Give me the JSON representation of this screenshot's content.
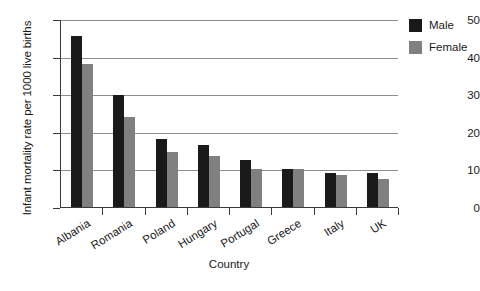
{
  "chart_data": {
    "type": "bar",
    "title": "",
    "xlabel": "Country",
    "ylabel": "Infant mortality rate per 1000 live births",
    "categories": [
      "Albania",
      "Romania",
      "Poland",
      "Hungary",
      "Portugal",
      "Greece",
      "Italy",
      "UK"
    ],
    "series": [
      {
        "name": "Male",
        "color": "#1a1a1a",
        "values": [
          45.5,
          29.8,
          18.0,
          16.5,
          12.5,
          10.2,
          9.0,
          9.0
        ]
      },
      {
        "name": "Female",
        "color": "#808080",
        "values": [
          38.0,
          24.0,
          14.5,
          13.5,
          10.2,
          10.0,
          8.5,
          7.5
        ]
      }
    ],
    "ylim": [
      0,
      50
    ],
    "yticks": [
      0,
      10,
      20,
      30,
      40,
      50
    ],
    "ytick_labels": [
      "0",
      "10",
      "20",
      "30",
      "40",
      "50"
    ],
    "grid": "horizontal",
    "legend_position": "top-right",
    "bar_grouping": "grouped"
  }
}
